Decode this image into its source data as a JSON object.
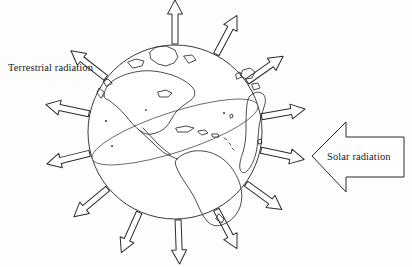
{
  "figure": {
    "background_color": "#fdfdfd",
    "stroke_color": "#2b2b2b",
    "width": 412,
    "height": 267
  },
  "labels": {
    "terrestrial": "Terrestrial radiation",
    "solar": "Solar radiation"
  },
  "globe": {
    "name": "earth-globe",
    "center_x": 175,
    "center_y": 132,
    "radius": 87,
    "equator_tilt_deg": -18,
    "equator_rx": 87,
    "equator_ry": 20
  },
  "terrestrial_arrows": {
    "count": 13,
    "description": "outline arrows radiating outward from the globe",
    "angles_deg": [
      270,
      298,
      325,
      350,
      12,
      36,
      62,
      88,
      114,
      140,
      166,
      192,
      218
    ]
  },
  "solar_arrow": {
    "name": "solar-radiation-arrow",
    "direction": "left",
    "tip_x": 312,
    "tip_y": 156,
    "tail_x": 404,
    "body_top": 137,
    "body_bottom": 177,
    "head_top": 122,
    "head_bottom": 192
  },
  "continents_label": "North America, South America, Greenland, Europe, Africa outlines"
}
